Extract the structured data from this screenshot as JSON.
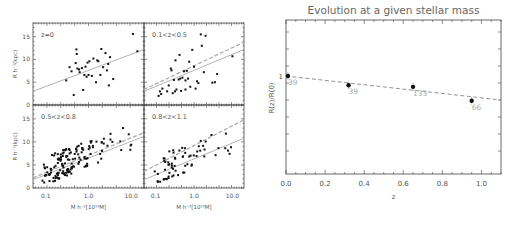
{
  "chart_data": [
    {
      "type": "scatter",
      "panel": "top-left",
      "annotation": "z=0",
      "xlabel": "M* h70^-2 [10^10 Msun]",
      "ylabel": "R_break h70^-1 (kpc)",
      "xscale": "log",
      "xlim": [
        0.05,
        20
      ],
      "ylim": [
        0,
        18
      ],
      "yticks": [
        "0",
        "5",
        "10",
        "15"
      ],
      "xticks": [],
      "fit_lines": [
        {
          "style": "solid",
          "x": [
            0.05,
            20
          ],
          "y": [
            3.0,
            12.2
          ]
        }
      ],
      "points": [
        [
          0.3,
          5.4
        ],
        [
          0.36,
          8.3
        ],
        [
          0.4,
          7.4
        ],
        [
          0.45,
          2.2
        ],
        [
          0.5,
          9.2
        ],
        [
          0.52,
          12.2
        ],
        [
          0.53,
          11.2
        ],
        [
          0.55,
          8.0
        ],
        [
          0.6,
          7.8
        ],
        [
          0.62,
          7.2
        ],
        [
          0.7,
          8.1
        ],
        [
          0.75,
          3.3
        ],
        [
          0.8,
          6.6
        ],
        [
          0.85,
          8.4
        ],
        [
          0.9,
          6.2
        ],
        [
          0.95,
          9.3
        ],
        [
          1.0,
          6.6
        ],
        [
          1.05,
          9.6
        ],
        [
          1.3,
          10.2
        ],
        [
          1.5,
          5.0
        ],
        [
          1.6,
          9.8
        ],
        [
          1.7,
          9.6
        ],
        [
          1.9,
          6.6
        ],
        [
          2.0,
          12.3
        ],
        [
          2.2,
          8.3
        ],
        [
          2.5,
          11.4
        ],
        [
          2.7,
          7.6
        ],
        [
          2.9,
          9.0
        ],
        [
          3.0,
          4.3
        ],
        [
          3.2,
          10.5
        ],
        [
          3.8,
          5.7
        ],
        [
          11.0,
          15.6
        ],
        [
          14.0,
          11.8
        ],
        [
          1.2,
          6.4
        ]
      ]
    },
    {
      "type": "scatter",
      "panel": "top-right",
      "annotation": "0.1<z<0.5",
      "xscale": "log",
      "xlim": [
        0.05,
        20
      ],
      "ylim": [
        0,
        18
      ],
      "fit_lines": [
        {
          "style": "solid",
          "x": [
            0.05,
            20
          ],
          "y": [
            3.0,
            12.2
          ]
        },
        {
          "style": "dashed",
          "x": [
            0.05,
            20
          ],
          "y": [
            3.4,
            13.8
          ]
        }
      ],
      "points": [
        [
          0.12,
          2.0
        ],
        [
          0.13,
          3.0
        ],
        [
          0.14,
          2.4
        ],
        [
          0.15,
          3.6
        ],
        [
          0.2,
          3.0
        ],
        [
          0.22,
          4.3
        ],
        [
          0.25,
          8.0
        ],
        [
          0.26,
          7.6
        ],
        [
          0.28,
          2.6
        ],
        [
          0.3,
          5.5
        ],
        [
          0.32,
          3.0
        ],
        [
          0.33,
          9.8
        ],
        [
          0.35,
          3.4
        ],
        [
          0.4,
          5.6
        ],
        [
          0.42,
          11.0
        ],
        [
          0.44,
          5.8
        ],
        [
          0.46,
          3.1
        ],
        [
          0.5,
          6.0
        ],
        [
          0.55,
          7.4
        ],
        [
          0.6,
          3.4
        ],
        [
          0.65,
          7.5
        ],
        [
          0.7,
          5.8
        ],
        [
          0.75,
          9.5
        ],
        [
          0.8,
          4.0
        ],
        [
          0.9,
          12.1
        ],
        [
          1.0,
          8.4
        ],
        [
          1.1,
          3.6
        ],
        [
          1.2,
          5.2
        ],
        [
          1.3,
          4.8
        ],
        [
          1.5,
          15.5
        ],
        [
          1.6,
          13.0
        ],
        [
          1.8,
          7.2
        ],
        [
          2.0,
          15.2
        ],
        [
          3.0,
          4.9
        ],
        [
          3.5,
          5.0
        ],
        [
          4.0,
          6.8
        ],
        [
          10.0,
          10.7
        ],
        [
          0.6,
          5.4
        ]
      ]
    },
    {
      "type": "scatter",
      "panel": "bottom-left",
      "annotation": "0.5<z<0.8",
      "xlabel": "M* h70^-2 [10^10 Msun]",
      "ylabel": "R_break h70^-1 (kpc)",
      "xscale": "log",
      "xlim": [
        0.05,
        20
      ],
      "ylim": [
        0,
        18
      ],
      "xticks": [
        "0.1",
        "1.0",
        "10.0"
      ],
      "yticks": [
        "0",
        "5",
        "10",
        "15"
      ],
      "fit_lines": [
        {
          "style": "solid",
          "x": [
            0.05,
            20
          ],
          "y": [
            1.8,
            11.2
          ]
        },
        {
          "style": "dashed",
          "x": [
            0.05,
            20
          ],
          "y": [
            2.2,
            12.0
          ]
        }
      ],
      "points_count": 150,
      "seed": 7
    },
    {
      "type": "scatter",
      "panel": "bottom-right",
      "annotation": "0.8<z<1.1",
      "xlabel": "M* h70^-2 [10^10 Msun]",
      "xscale": "log",
      "xlim": [
        0.05,
        20
      ],
      "ylim": [
        0,
        18
      ],
      "xticks": [
        "0.1",
        "1.0",
        "10.0"
      ],
      "fit_lines": [
        {
          "style": "solid",
          "x": [
            0.05,
            20
          ],
          "y": [
            1.8,
            10.8
          ]
        },
        {
          "style": "dashed",
          "x": [
            0.05,
            20
          ],
          "y": [
            3.6,
            14.8
          ]
        }
      ],
      "points_count": 66,
      "seed": 13
    },
    {
      "type": "line",
      "panel": "right",
      "title": "Evolution at a given stellar mass",
      "xlabel": "z",
      "ylabel": "R_break(z)/R_break(0)",
      "xlim": [
        0.0,
        1.1
      ],
      "xticks": [
        "0.0",
        "0.2",
        "0.4",
        "0.6",
        "0.8",
        "1.0"
      ],
      "yticks": [
        "1"
      ],
      "points": [
        {
          "z": 0.01,
          "ratio": 1.0,
          "n": "39"
        },
        {
          "z": 0.32,
          "ratio": 0.94,
          "n": "39"
        },
        {
          "z": 0.65,
          "ratio": 0.93,
          "n": "133"
        },
        {
          "z": 0.95,
          "ratio": 0.84,
          "n": "66"
        }
      ],
      "fit_line": {
        "style": "dashed",
        "x": [
          0.0,
          1.1
        ],
        "y": [
          1.0,
          0.845
        ]
      }
    }
  ],
  "labels": {
    "right_title": "Evolution at a given stellar mass",
    "right_xlabel": "z",
    "right_ylabel": "R(z)/R(0)",
    "left_ylabel": "R h⁻¹(kpc)",
    "left_xlabel": "M h⁻²[10¹⁰M]"
  }
}
